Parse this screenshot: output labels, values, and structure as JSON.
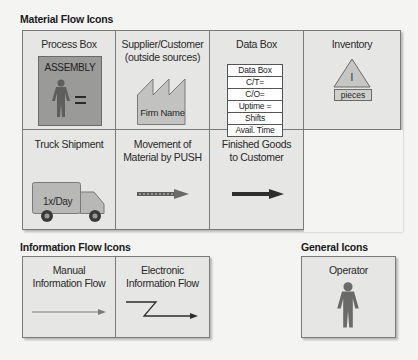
{
  "material_flow": {
    "title": "Material Flow Icons",
    "process_box": {
      "label": "Process Box",
      "box_text": "ASSEMBLY",
      "fill": "#9a9a98",
      "icon": "operator-icon"
    },
    "supplier": {
      "label_line1": "Supplier/Customer",
      "label_line2": "(outside sources)",
      "factory_text": "Firm Name",
      "icon": "factory-icon"
    },
    "data_box": {
      "label": "Data Box",
      "rows": [
        "Data Box",
        "C/T=",
        "C/O=",
        "Uptime =",
        "Shifts",
        "Avail. Time"
      ]
    },
    "inventory": {
      "label": "Inventory",
      "triangle_text": "I",
      "unit_text": "pieces",
      "icon": "inventory-triangle-icon"
    },
    "truck": {
      "label": "Truck Shipment",
      "truck_text": "1x/Day",
      "icon": "truck-icon"
    },
    "push": {
      "label_line1": "Movement of",
      "label_line2": "Material by PUSH",
      "icon": "push-arrow-icon"
    },
    "finished": {
      "label_line1": "Finished Goods",
      "label_line2": "to Customer",
      "icon": "shipment-arrow-icon"
    }
  },
  "information_flow": {
    "title": "Information Flow Icons",
    "manual": {
      "label_line1": "Manual",
      "label_line2": "Information Flow",
      "icon": "manual-arrow-icon"
    },
    "electronic": {
      "label_line1": "Electronic",
      "label_line2": "Information Flow",
      "icon": "electronic-zigzag-arrow-icon"
    }
  },
  "general": {
    "title": "General Icons",
    "operator": {
      "label": "Operator",
      "icon": "operator-icon"
    }
  },
  "colors": {
    "panel_bg": "#e6e6e4",
    "border": "#7a7a7a",
    "icon_gray": "#6f6f6d",
    "light_gray": "#b5b5b3",
    "dark": "#333333"
  }
}
